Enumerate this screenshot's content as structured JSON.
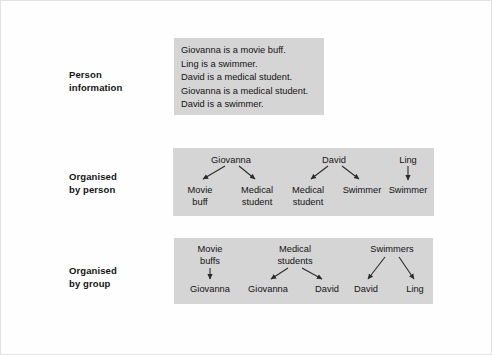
{
  "figure": {
    "background_color": "#ffffff",
    "panel_color": "#d5d5d5",
    "text_color": "#131313"
  },
  "rows": [
    {
      "label": "Person\ninformation",
      "label_x": 68,
      "label_y": 68
    },
    {
      "label": "Organised\nby person",
      "label_x": 68,
      "label_y": 170
    },
    {
      "label": "Organised\nby group",
      "label_x": 68,
      "label_y": 264
    }
  ],
  "person_information": {
    "lines": [
      "Giovanna is a movie buff.",
      "Ling is a swimmer.",
      "David is a medical student.",
      "Giovanna is a medical student.",
      "David is a swimmer."
    ]
  },
  "organised_by_person": {
    "trees": [
      {
        "root": "Giovanna",
        "root_x": 58,
        "root_y": 6,
        "children": [
          {
            "label": "Movie\nbuff",
            "x": 27,
            "y": 36
          },
          {
            "label": "Medical\nstudent",
            "x": 84,
            "y": 36
          }
        ]
      },
      {
        "root": "David",
        "root_x": 161,
        "root_y": 6,
        "children": [
          {
            "label": "Medical\nstudent",
            "x": 135,
            "y": 36
          },
          {
            "label": "Swimmer",
            "x": 189,
            "y": 36
          }
        ]
      },
      {
        "root": "Ling",
        "root_x": 235,
        "root_y": 6,
        "children": [
          {
            "label": "Swimmer",
            "x": 235,
            "y": 36
          }
        ]
      }
    ]
  },
  "organised_by_group": {
    "trees": [
      {
        "root": "Movie\nbuffs",
        "root_x": 36,
        "root_y": 5,
        "children": [
          {
            "label": "Giovanna",
            "x": 36,
            "y": 45
          }
        ]
      },
      {
        "root": "Medical\nstudents",
        "root_x": 121,
        "root_y": 5,
        "children": [
          {
            "label": "Giovanna",
            "x": 94,
            "y": 45
          },
          {
            "label": "David",
            "x": 153,
            "y": 45
          }
        ]
      },
      {
        "root": "Swimmers",
        "root_x": 218,
        "root_y": 5,
        "children": [
          {
            "label": "David",
            "x": 192,
            "y": 45
          },
          {
            "label": "Ling",
            "x": 241,
            "y": 45
          }
        ]
      }
    ]
  }
}
